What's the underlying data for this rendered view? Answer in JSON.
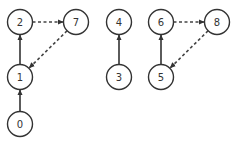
{
  "diagram": {
    "type": "directed-graph",
    "node_radius": 12.5,
    "colors": {
      "stroke": "#333333",
      "fill": "#ffffff",
      "text": "#333333"
    },
    "nodes": [
      {
        "id": "0",
        "label": "0",
        "x": 20,
        "y": 124
      },
      {
        "id": "1",
        "label": "1",
        "x": 20,
        "y": 77
      },
      {
        "id": "2",
        "label": "2",
        "x": 20,
        "y": 22
      },
      {
        "id": "7",
        "label": "7",
        "x": 76,
        "y": 22
      },
      {
        "id": "3",
        "label": "3",
        "x": 119,
        "y": 77
      },
      {
        "id": "4",
        "label": "4",
        "x": 119,
        "y": 22
      },
      {
        "id": "5",
        "label": "5",
        "x": 161,
        "y": 77
      },
      {
        "id": "6",
        "label": "6",
        "x": 161,
        "y": 22
      },
      {
        "id": "8",
        "label": "8",
        "x": 217,
        "y": 22
      }
    ],
    "edges": [
      {
        "from": "0",
        "to": "1",
        "style": "solid"
      },
      {
        "from": "1",
        "to": "2",
        "style": "solid"
      },
      {
        "from": "2",
        "to": "7",
        "style": "dashed"
      },
      {
        "from": "7",
        "to": "1",
        "style": "dashed"
      },
      {
        "from": "3",
        "to": "4",
        "style": "solid"
      },
      {
        "from": "5",
        "to": "6",
        "style": "solid"
      },
      {
        "from": "6",
        "to": "8",
        "style": "dashed"
      },
      {
        "from": "8",
        "to": "5",
        "style": "dashed"
      }
    ]
  }
}
